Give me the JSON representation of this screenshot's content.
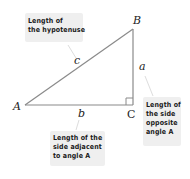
{
  "diagram": {
    "type": "right-triangle",
    "vertices": {
      "A": "A",
      "B": "B",
      "C": "C"
    },
    "sides": {
      "a": "a",
      "b": "b",
      "c": "c"
    },
    "callouts": {
      "hypotenuse": {
        "lines": [
          "Length of",
          "the hypotenuse"
        ]
      },
      "opposite": {
        "lines": [
          "Length of",
          "the side",
          "opposite",
          "angle A"
        ]
      },
      "adjacent": {
        "lines": [
          "Length of the",
          "side adjacent",
          "to angle A"
        ]
      }
    },
    "colors": {
      "line": "#8a8a8a",
      "callout_bg": "#efefef",
      "text": "#1a1a1a"
    }
  }
}
